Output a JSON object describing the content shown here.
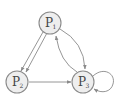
{
  "diagram": {
    "type": "state-transition-graph",
    "nodes": [
      {
        "id": "P1",
        "label": "P",
        "subscript": "1"
      },
      {
        "id": "P2",
        "label": "P",
        "subscript": "2"
      },
      {
        "id": "P3",
        "label": "P",
        "subscript": "3"
      }
    ],
    "edges": [
      {
        "from": "P1",
        "to": "P2",
        "kind": "straight",
        "note": "parallel arrow 1"
      },
      {
        "from": "P1",
        "to": "P2",
        "kind": "straight",
        "note": "parallel arrow 2"
      },
      {
        "from": "P2",
        "to": "P3",
        "kind": "straight"
      },
      {
        "from": "P1",
        "to": "P3",
        "kind": "curved"
      },
      {
        "from": "P3",
        "to": "P1",
        "kind": "curved"
      },
      {
        "from": "P3",
        "to": "P3",
        "kind": "self-loop"
      }
    ],
    "colors": {
      "node_fill": "#eeeeee",
      "stroke": "#8a8a8a",
      "text": "#444444"
    }
  }
}
